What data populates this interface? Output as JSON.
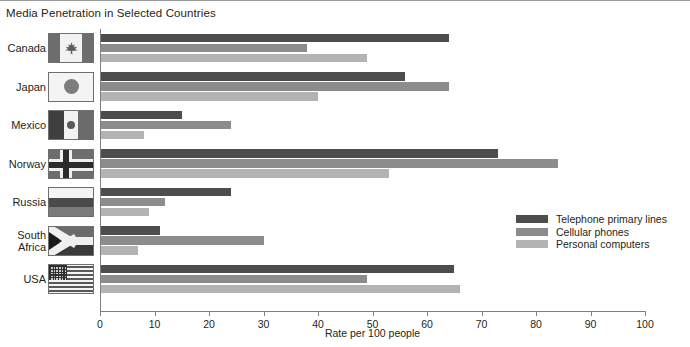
{
  "chart_title": "Media Penetration in Selected Countries",
  "x_axis_label": "Rate per 100 people",
  "legend": {
    "items": [
      {
        "label": "Telephone primary lines",
        "color": "#4d4d4d"
      },
      {
        "label": "Cellular phones",
        "color": "#8c8c8c"
      },
      {
        "label": "Personal computers",
        "color": "#b3b3b3"
      }
    ]
  },
  "axis": {
    "ticks": [
      "0",
      "10",
      "20",
      "30",
      "40",
      "50",
      "60",
      "70",
      "80",
      "90",
      "100"
    ]
  },
  "countries": [
    {
      "name": "Canada",
      "flag": "canada-flag"
    },
    {
      "name": "Japan",
      "flag": "japan-flag"
    },
    {
      "name": "Mexico",
      "flag": "mexico-flag"
    },
    {
      "name": "Norway",
      "flag": "norway-flag"
    },
    {
      "name": "Russia",
      "flag": "russia-flag"
    },
    {
      "name": "South\nAfrica",
      "flag": "south-africa-flag"
    },
    {
      "name": "USA",
      "flag": "usa-flag"
    }
  ],
  "chart_data": {
    "type": "bar",
    "orientation": "horizontal",
    "title": "Media Penetration in Selected Countries",
    "xlabel": "Rate per 100 people",
    "ylabel": "",
    "xlim": [
      0,
      100
    ],
    "xticks": [
      0,
      10,
      20,
      30,
      40,
      50,
      60,
      70,
      80,
      90,
      100
    ],
    "grid": false,
    "legend_position": "right-middle",
    "categories": [
      "Canada",
      "Japan",
      "Mexico",
      "Norway",
      "Russia",
      "South Africa",
      "USA"
    ],
    "series": [
      {
        "name": "Telephone primary lines",
        "color": "#4d4d4d",
        "values": [
          64,
          56,
          15,
          73,
          24,
          11,
          65
        ]
      },
      {
        "name": "Cellular phones",
        "color": "#8c8c8c",
        "values": [
          38,
          64,
          24,
          84,
          12,
          30,
          49
        ]
      },
      {
        "name": "Personal computers",
        "color": "#b3b3b3",
        "values": [
          49,
          40,
          8,
          53,
          9,
          7,
          66
        ]
      }
    ]
  }
}
